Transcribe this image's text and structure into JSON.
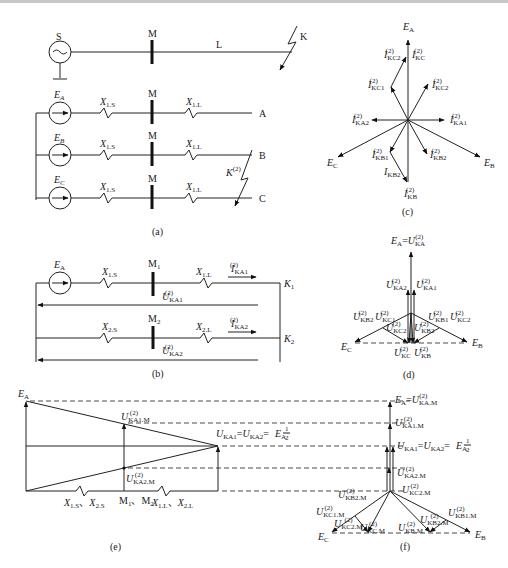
{
  "page": {
    "top_rule_color": "#c8c8c8"
  },
  "panel_a": {
    "caption": "(a)",
    "single_line": {
      "source": "S",
      "bus": "M",
      "line": "L",
      "fault": "K"
    },
    "phases": [
      {
        "emf": "E",
        "emf_sub": "A",
        "xs": "X",
        "xs_sub": "1.S",
        "bus": "M",
        "xl": "X",
        "xl_sub": "1.L",
        "end": "A"
      },
      {
        "emf": "E",
        "emf_sub": "B",
        "xs": "X",
        "xs_sub": "1.S",
        "bus": "M",
        "xl": "X",
        "xl_sub": "1.L",
        "end": "B"
      },
      {
        "emf": "E",
        "emf_sub": "C",
        "xs": "X",
        "xs_sub": "1.S",
        "bus": "M",
        "xl": "X",
        "xl_sub": "1.L",
        "end": "C"
      }
    ],
    "fault_label": "K",
    "fault_sup": "(2)"
  },
  "panel_b": {
    "caption": "(b)",
    "pos": {
      "emf": "E",
      "emf_sub": "A",
      "xs": "X",
      "xs_sub": "1.S",
      "bus": "M",
      "bus_sub": "1",
      "xl": "X",
      "xl_sub": "1.L",
      "i": "I",
      "i_sub": "KA1",
      "u": "U",
      "u_sub": "KA1",
      "node": "K",
      "node_sub": "1",
      "sup": "(2)"
    },
    "neg": {
      "xs": "X",
      "xs_sub": "2.S",
      "bus": "M",
      "bus_sub": "2",
      "xl": "X",
      "xl_sub": "2.L",
      "i": "I",
      "i_sub": "KA2",
      "u": "U",
      "u_sub": "KA2",
      "node": "K",
      "node_sub": "2",
      "sup": "(2)"
    }
  },
  "panel_c": {
    "caption": "(c)",
    "labels": [
      {
        "main": "E",
        "sub": "A",
        "sup": ""
      },
      {
        "main": "E",
        "sub": "B",
        "sup": ""
      },
      {
        "main": "E",
        "sub": "C",
        "sup": ""
      },
      {
        "main": "I",
        "sub": "KC2",
        "sup": "(2)"
      },
      {
        "main": "I",
        "sub": "KC",
        "sup": "(2)"
      },
      {
        "main": "I",
        "sub": "KC1",
        "sup": "(2)"
      },
      {
        "main": "I",
        "sub": "KC2",
        "sup": "(2)"
      },
      {
        "main": "I",
        "sub": "KA2",
        "sup": "(2)"
      },
      {
        "main": "I",
        "sub": "KA1",
        "sup": "(2)"
      },
      {
        "main": "I",
        "sub": "KB1",
        "sup": "(2)"
      },
      {
        "main": "I",
        "sub": "KB2",
        "sup": "(2)"
      },
      {
        "main": "I",
        "sub": "KB2",
        "sup": ""
      },
      {
        "main": "I",
        "sub": "KB",
        "sup": "(2)"
      }
    ]
  },
  "panel_d": {
    "caption": "(d)",
    "top": {
      "left": "E",
      "left_sub": "A",
      "eq": "=",
      "right": "U",
      "right_sub": "KA",
      "sup": "(2)"
    },
    "labels": [
      {
        "main": "U",
        "sub": "KA2",
        "sup": "(2)"
      },
      {
        "main": "U",
        "sub": "KA1",
        "sup": "(2)"
      },
      {
        "main": "U",
        "sub": "KB2",
        "sup": "(2)"
      },
      {
        "main": "U",
        "sub": "KC1",
        "sup": "(2)"
      },
      {
        "main": "U",
        "sub": "KB1",
        "sup": "(2)"
      },
      {
        "main": "U",
        "sub": "KC2",
        "sup": "(2)"
      },
      {
        "main": "U",
        "sub": "KC2",
        "sup": "(2)"
      },
      {
        "main": "U",
        "sub": "KB2",
        "sup": "(2)"
      },
      {
        "main": "E",
        "sub": "C",
        "sup": ""
      },
      {
        "main": "E",
        "sub": "B",
        "sup": ""
      },
      {
        "main": "U",
        "sub": "KC",
        "sup": "(2)"
      },
      {
        "main": "U",
        "sub": "KB",
        "sup": "(2)"
      }
    ]
  },
  "panel_e": {
    "caption": "(e)",
    "ea": {
      "main": "E",
      "sub": "A"
    },
    "u1m": {
      "main": "U",
      "sub": "KA1.M",
      "sup": "(2)"
    },
    "u2m": {
      "main": "U",
      "sub": "KA2.M",
      "sup": "(2)"
    },
    "mid_eq": {
      "a": "U",
      "a_sub": "KA1",
      "b": "U",
      "b_sub": "KA2",
      "sup": "(2)",
      "eq": "=",
      "frac_num": "1",
      "frac_den": "2",
      "e": "E",
      "e_sub": "A"
    },
    "x_left": "X",
    "x_left_sub1": "1.S",
    "sep": "、",
    "x_left_sub2": "2.S",
    "bus": "M",
    "bus_sub1": "1",
    "bus_sub2": "2",
    "x_right": "X",
    "x_right_sub1": "1.L",
    "x_right_sub2": "2.L"
  },
  "panel_f": {
    "caption": "(f)",
    "top": {
      "left": "E",
      "left_sub": "A",
      "eq": "=",
      "right": "U",
      "right_sub": "KA.M",
      "sup": "(2)"
    },
    "u1m": {
      "main": "U",
      "sub": "KA1.M",
      "sup": "(2)"
    },
    "mid_eq": {
      "a": "U",
      "a_sub": "KA1",
      "b": "U",
      "b_sub": "KA2",
      "sup": "(2)",
      "eq": "=",
      "frac_num": "1",
      "frac_den": "2",
      "e": "E",
      "e_sub": "A"
    },
    "labels": [
      {
        "main": "U",
        "sub": "KA2.M",
        "sup": "(2)"
      },
      {
        "main": "U",
        "sub": "KB2.M",
        "sup": "(2)"
      },
      {
        "main": "U",
        "sub": "KC2.M",
        "sup": "(2)"
      },
      {
        "main": "U",
        "sub": "KC1.M",
        "sup": "(2)"
      },
      {
        "main": "U",
        "sub": "KB1.M",
        "sup": "(2)"
      },
      {
        "main": "U",
        "sub": "KC2.M",
        "sup": "(2)"
      },
      {
        "main": "U",
        "sub": "KC.M",
        "sup": "(2)"
      },
      {
        "main": "U",
        "sub": "KB.M",
        "sup": "(2)"
      },
      {
        "main": "U",
        "sub": "KB2.M",
        "sup": "(2)"
      },
      {
        "main": "E",
        "sub": "C",
        "sup": ""
      },
      {
        "main": "E",
        "sub": "B",
        "sup": ""
      }
    ]
  }
}
